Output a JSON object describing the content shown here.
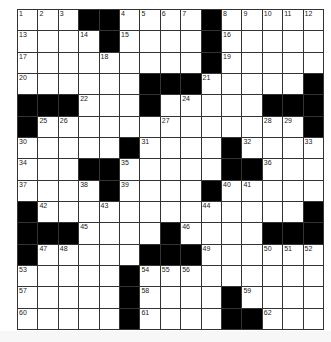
{
  "puzzle": {
    "rows": 15,
    "cols": 15,
    "pattern": [
      "...##....#.....",
      "....#....#.....",
      ".........#.....",
      "......###.....#",
      "###...#.....###",
      "#.............#",
      ".....#....#....",
      "...##.....##...",
      "....#....#.....",
      "#.............#",
      "###....#....###",
      "#.....###......",
      ".....#.........",
      ".....#....#....",
      ".....#....##..."
    ],
    "numbers": [
      {
        "r": 0,
        "c": 0,
        "n": "1"
      },
      {
        "r": 0,
        "c": 1,
        "n": "2"
      },
      {
        "r": 0,
        "c": 2,
        "n": "3"
      },
      {
        "r": 0,
        "c": 5,
        "n": "4"
      },
      {
        "r": 0,
        "c": 6,
        "n": "5"
      },
      {
        "r": 0,
        "c": 7,
        "n": "6"
      },
      {
        "r": 0,
        "c": 8,
        "n": "7"
      },
      {
        "r": 0,
        "c": 10,
        "n": "8"
      },
      {
        "r": 0,
        "c": 11,
        "n": "9"
      },
      {
        "r": 0,
        "c": 12,
        "n": "10"
      },
      {
        "r": 0,
        "c": 13,
        "n": "11"
      },
      {
        "r": 0,
        "c": 14,
        "n": "12"
      },
      {
        "r": 1,
        "c": 0,
        "n": "13"
      },
      {
        "r": 1,
        "c": 3,
        "n": "14"
      },
      {
        "r": 1,
        "c": 5,
        "n": "15"
      },
      {
        "r": 1,
        "c": 10,
        "n": "16"
      },
      {
        "r": 2,
        "c": 0,
        "n": "17"
      },
      {
        "r": 2,
        "c": 4,
        "n": "18"
      },
      {
        "r": 2,
        "c": 10,
        "n": "19"
      },
      {
        "r": 3,
        "c": 0,
        "n": "20"
      },
      {
        "r": 3,
        "c": 9,
        "n": "21"
      },
      {
        "r": 4,
        "c": 3,
        "n": "22"
      },
      {
        "r": 4,
        "c": 6,
        "n": "23"
      },
      {
        "r": 4,
        "c": 8,
        "n": "24"
      },
      {
        "r": 5,
        "c": 1,
        "n": "25"
      },
      {
        "r": 5,
        "c": 2,
        "n": "26"
      },
      {
        "r": 5,
        "c": 7,
        "n": "27"
      },
      {
        "r": 5,
        "c": 12,
        "n": "28"
      },
      {
        "r": 5,
        "c": 13,
        "n": "29"
      },
      {
        "r": 6,
        "c": 0,
        "n": "30"
      },
      {
        "r": 6,
        "c": 6,
        "n": "31"
      },
      {
        "r": 6,
        "c": 11,
        "n": "32"
      },
      {
        "r": 6,
        "c": 14,
        "n": "33"
      },
      {
        "r": 7,
        "c": 0,
        "n": "34"
      },
      {
        "r": 7,
        "c": 5,
        "n": "35"
      },
      {
        "r": 7,
        "c": 12,
        "n": "36"
      },
      {
        "r": 8,
        "c": 0,
        "n": "37"
      },
      {
        "r": 8,
        "c": 3,
        "n": "38"
      },
      {
        "r": 8,
        "c": 5,
        "n": "39"
      },
      {
        "r": 8,
        "c": 10,
        "n": "40"
      },
      {
        "r": 8,
        "c": 11,
        "n": "41"
      },
      {
        "r": 9,
        "c": 1,
        "n": "42"
      },
      {
        "r": 9,
        "c": 4,
        "n": "43"
      },
      {
        "r": 9,
        "c": 9,
        "n": "44"
      },
      {
        "r": 10,
        "c": 3,
        "n": "45"
      },
      {
        "r": 10,
        "c": 8,
        "n": "46"
      },
      {
        "r": 11,
        "c": 1,
        "n": "47"
      },
      {
        "r": 11,
        "c": 2,
        "n": "48"
      },
      {
        "r": 11,
        "c": 9,
        "n": "49"
      },
      {
        "r": 11,
        "c": 12,
        "n": "50"
      },
      {
        "r": 11,
        "c": 13,
        "n": "51"
      },
      {
        "r": 11,
        "c": 14,
        "n": "52"
      },
      {
        "r": 12,
        "c": 0,
        "n": "53"
      },
      {
        "r": 12,
        "c": 6,
        "n": "54"
      },
      {
        "r": 12,
        "c": 7,
        "n": "55"
      },
      {
        "r": 12,
        "c": 8,
        "n": "56"
      },
      {
        "r": 13,
        "c": 0,
        "n": "57"
      },
      {
        "r": 13,
        "c": 6,
        "n": "58"
      },
      {
        "r": 13,
        "c": 11,
        "n": "59"
      },
      {
        "r": 14,
        "c": 0,
        "n": "60"
      },
      {
        "r": 14,
        "c": 6,
        "n": "61"
      },
      {
        "r": 14,
        "c": 12,
        "n": "62"
      }
    ],
    "colors": {
      "block": "#000000",
      "cell": "#ffffff",
      "grid_line": "#333333"
    }
  }
}
